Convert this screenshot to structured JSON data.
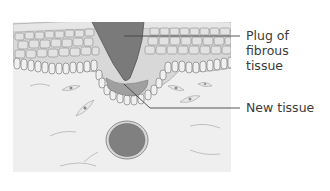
{
  "figure": {
    "type": "anatomical cross-section of healing skin",
    "labels": {
      "plug": [
        "Plug of",
        "fibrous",
        "tissue"
      ],
      "new_tissue": "New tissue"
    },
    "colors": {
      "plug_fill": "#7a7a7a",
      "plug_stroke": "#555555",
      "epidermis_fill": "#d6d6d6",
      "cell_fill": "#e4e4e4",
      "cell_stroke": "#8a8a8a",
      "basal_cell_fill": "#efefef",
      "dermis_fill": "#efefef",
      "vessel_fill": "#808080",
      "vessel_ring": "#d0d0d0",
      "leader_line": "#444444",
      "text": "#3a3a3a"
    }
  }
}
